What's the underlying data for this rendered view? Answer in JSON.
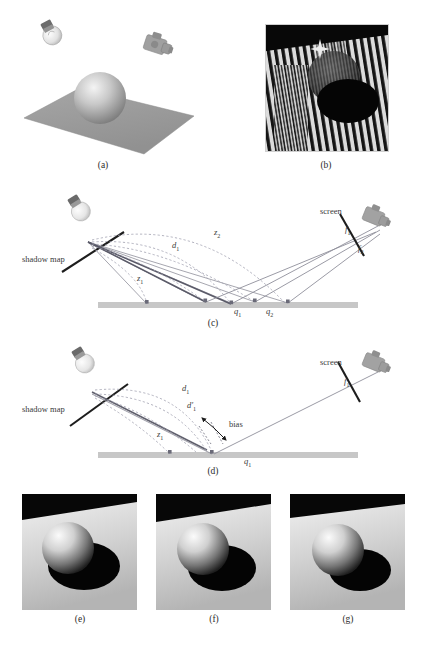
{
  "figure": {
    "background_color": "#ffffff",
    "width": 426,
    "height": 654
  },
  "palette": {
    "ground_plane_gray": "#9a9a9a",
    "sphere_light": "#f2f2f2",
    "sphere_dark": "#6a6a6a",
    "ray_gray": "#8c8c99",
    "ray_dark": "#555566",
    "dashed_gray": "#9a9aa8",
    "ground_bar": "#c4c4c4",
    "text": "#2b2b2b",
    "plane_fill": "#9d9d9d",
    "stripe_dark": "#101010",
    "stripe_light": "#d8d8d8",
    "shadow_black": "#050505"
  },
  "panels": [
    {
      "id": "a",
      "caption": "(a)",
      "type": "render",
      "description": "Scene setup: light bulb at upper left, camera at upper right, sphere resting on a gray ground plane",
      "objects": [
        "light-bulb",
        "camera",
        "sphere",
        "ground-plane"
      ]
    },
    {
      "id": "b",
      "caption": "(b)",
      "type": "render",
      "description": "Shadow acne: severe self-shadowing stripe artifacts across plane and sphere",
      "objects": [
        "stripe-artifacts",
        "sphere",
        "shadow"
      ]
    },
    {
      "id": "c",
      "caption": "(c)",
      "type": "diagram",
      "description": "Shadow map depth comparison without bias; z1 and z2 stored depths vs d1 distance; screen fragments f1 and f2 map to surface points q1 and q2",
      "labels": [
        {
          "id": "shadow-map",
          "text": "shadow map",
          "italic": false,
          "x": 22,
          "y": 258
        },
        {
          "id": "screen",
          "text": "screen",
          "italic": false,
          "x": 320,
          "y": 212
        },
        {
          "id": "z2",
          "text": "z",
          "sub": "2",
          "x": 214,
          "y": 231
        },
        {
          "id": "d1",
          "text": "d",
          "sub": "1",
          "x": 173,
          "y": 245
        },
        {
          "id": "z1",
          "text": "z",
          "sub": "1",
          "x": 137,
          "y": 278
        },
        {
          "id": "q1",
          "text": "q",
          "sub": "1",
          "x": 237,
          "y": 312
        },
        {
          "id": "q2",
          "text": "q",
          "sub": "2",
          "x": 268,
          "y": 312
        },
        {
          "id": "f1",
          "text": "f",
          "sub": "1",
          "x": 349,
          "y": 230
        },
        {
          "id": "f2",
          "text": "f",
          "sub": "2",
          "x": 360,
          "y": 248
        }
      ]
    },
    {
      "id": "d",
      "caption": "(d)",
      "type": "diagram",
      "description": "Depth bias applied: biased distance d1-prime shifts the comparison point away from surface point q1",
      "labels": [
        {
          "id": "shadow-map",
          "text": "shadow map",
          "italic": false,
          "x": 22,
          "y": 408
        },
        {
          "id": "screen",
          "text": "screen",
          "italic": false,
          "x": 320,
          "y": 363
        },
        {
          "id": "d1",
          "text": "d",
          "sub": "1",
          "x": 183,
          "y": 388
        },
        {
          "id": "d1-prime",
          "text": "d′",
          "sub": "1",
          "x": 188,
          "y": 405
        },
        {
          "id": "bias",
          "text": "bias",
          "italic": false,
          "x": 230,
          "y": 424
        },
        {
          "id": "z1",
          "text": "z",
          "sub": "1",
          "x": 158,
          "y": 434
        },
        {
          "id": "q1",
          "text": "q",
          "sub": "1",
          "x": 247,
          "y": 462
        },
        {
          "id": "f1",
          "text": "f",
          "sub": "1",
          "x": 348,
          "y": 382
        }
      ]
    },
    {
      "id": "e",
      "caption": "(e)",
      "type": "render",
      "description": "Rendered sphere with hard shadow, bias too small / correct baseline"
    },
    {
      "id": "f",
      "caption": "(f)",
      "type": "render",
      "description": "Rendered sphere with hard shadow, moderate bias"
    },
    {
      "id": "g",
      "caption": "(g)",
      "type": "render",
      "description": "Rendered sphere with hard shadow, larger bias causing detached shadow (peter-panning)"
    }
  ],
  "captions": {
    "a": "(a)",
    "b": "(b)",
    "c": "(c)",
    "d": "(d)",
    "e": "(e)",
    "f": "(f)",
    "g": "(g)"
  }
}
